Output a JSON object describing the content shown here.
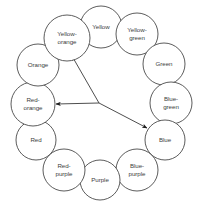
{
  "diagram": {
    "type": "color-wheel-triad",
    "geometry": {
      "width": 200,
      "height": 203,
      "center_x": 100,
      "center_y": 101,
      "ring_radius": 67,
      "hub_x": 99,
      "hub_y": 103
    },
    "style": {
      "background": "#ffffff",
      "circle_fill": "#ffffff",
      "circle_stroke": "#4a4a4a",
      "label_color": "#3d3d3d",
      "arrow_color": "#1c1c1c"
    },
    "nodes": [
      {
        "id": "yellow",
        "label": "Yellow",
        "lines": [
          "Yellow"
        ],
        "cx": 101,
        "cy": 27,
        "r": 21
      },
      {
        "id": "yellow-green",
        "label": "Yellow-green",
        "lines": [
          "Yellow-",
          "green"
        ],
        "cx": 137,
        "cy": 34,
        "r": 21
      },
      {
        "id": "green",
        "label": "Green",
        "lines": [
          "Green"
        ],
        "cx": 164,
        "cy": 64,
        "r": 21
      },
      {
        "id": "blue-green",
        "label": "Blue-green",
        "lines": [
          "Blue-",
          "green"
        ],
        "cx": 171,
        "cy": 103,
        "r": 21
      },
      {
        "id": "blue",
        "label": "Blue",
        "lines": [
          "Blue"
        ],
        "cx": 165,
        "cy": 140,
        "r": 20
      },
      {
        "id": "blue-purple",
        "label": "Blue-purple",
        "lines": [
          "Blue-",
          "purple"
        ],
        "cx": 137,
        "cy": 170,
        "r": 21
      },
      {
        "id": "purple",
        "label": "Purple",
        "lines": [
          "Purple"
        ],
        "cx": 100,
        "cy": 180,
        "r": 20
      },
      {
        "id": "red-purple",
        "label": "Red-purple",
        "lines": [
          "Red-",
          "purple"
        ],
        "cx": 64,
        "cy": 170,
        "r": 21
      },
      {
        "id": "red",
        "label": "Red",
        "lines": [
          "Red"
        ],
        "cx": 36,
        "cy": 140,
        "r": 20
      },
      {
        "id": "red-orange",
        "label": "Red-orange",
        "lines": [
          "Red-",
          "orange"
        ],
        "cx": 33,
        "cy": 104,
        "r": 22
      },
      {
        "id": "orange",
        "label": "Orange",
        "lines": [
          "Orange"
        ],
        "cx": 38,
        "cy": 65,
        "r": 21
      },
      {
        "id": "yellow-orange",
        "label": "Yellow-orange",
        "lines": [
          "Yellow-",
          "orange"
        ],
        "cx": 67,
        "cy": 38,
        "r": 23
      }
    ],
    "arrows": [
      {
        "id": "hub-to-yellow-orange",
        "from": "hub",
        "to": "yellow-orange",
        "x1": 99,
        "y1": 103,
        "x2": 72,
        "y2": 56
      },
      {
        "id": "hub-to-red-orange",
        "from": "hub",
        "to": "red-orange",
        "x1": 99,
        "y1": 103,
        "x2": 56,
        "y2": 104
      },
      {
        "id": "hub-to-blue",
        "from": "hub",
        "to": "blue",
        "x1": 99,
        "y1": 103,
        "x2": 147,
        "y2": 128
      }
    ]
  }
}
